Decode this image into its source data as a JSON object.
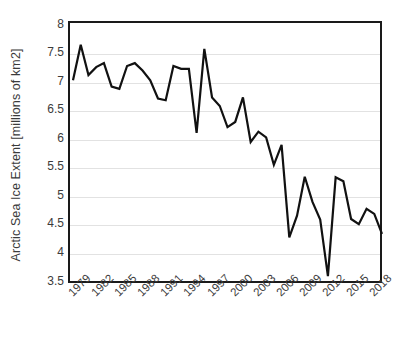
{
  "chart_data": {
    "type": "line",
    "title": "",
    "xlabel": "",
    "ylabel": "Arctic Sea Ice Extent [millions of km2]",
    "ylim": [
      3.5,
      8
    ],
    "xlim": [
      1979,
      2019
    ],
    "grid": true,
    "legend": null,
    "line_color": "#111111",
    "x": [
      1979,
      1980,
      1981,
      1982,
      1983,
      1984,
      1985,
      1986,
      1987,
      1988,
      1989,
      1990,
      1991,
      1992,
      1993,
      1994,
      1995,
      1996,
      1997,
      1998,
      1999,
      2000,
      2001,
      2002,
      2003,
      2004,
      2005,
      2006,
      2007,
      2008,
      2009,
      2010,
      2011,
      2012,
      2013,
      2014,
      2015,
      2016,
      2017,
      2018,
      2019
    ],
    "values": [
      7.05,
      7.67,
      7.14,
      7.28,
      7.35,
      6.94,
      6.9,
      7.3,
      7.35,
      7.22,
      7.05,
      6.73,
      6.7,
      7.3,
      7.25,
      7.25,
      6.13,
      7.6,
      6.75,
      6.6,
      6.23,
      6.32,
      6.75,
      5.97,
      6.15,
      6.05,
      5.57,
      5.92,
      4.3,
      4.68,
      5.36,
      4.92,
      4.61,
      3.62,
      5.35,
      5.28,
      4.62,
      4.53,
      4.8,
      4.71,
      4.36
    ],
    "x_tick_labels": [
      "1979",
      "1982",
      "1985",
      "1988",
      "1991",
      "1994",
      "1997",
      "2000",
      "2003",
      "2006",
      "2009",
      "2012",
      "2015",
      "2018"
    ],
    "x_tick_values": [
      1979,
      1982,
      1985,
      1988,
      1991,
      1994,
      1997,
      2000,
      2003,
      2006,
      2009,
      2012,
      2015,
      2018
    ],
    "y_tick_labels": [
      "8",
      "7.5",
      "7",
      "6.5",
      "6",
      "5.5",
      "5",
      "4.5",
      "4",
      "3.5"
    ],
    "y_tick_values": [
      8,
      7.5,
      7,
      6.5,
      6,
      5.5,
      5,
      4.5,
      4,
      3.5
    ]
  }
}
